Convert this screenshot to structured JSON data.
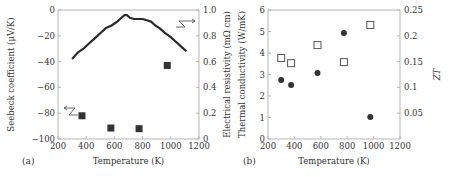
{
  "chart_data": [
    {
      "panel": "a",
      "panel_label": "(a)",
      "type": "line",
      "xlabel": "Temperature (K)",
      "ylabel": "Seebeck coefficient (μV/K)",
      "y2label": "Electrical resistivity (mΩ cm)",
      "xlim": [
        200,
        1200
      ],
      "ylim": [
        -100,
        0
      ],
      "y2lim": [
        0,
        1.0
      ],
      "xticks": [
        200,
        400,
        600,
        800,
        1000,
        1200
      ],
      "yticks": [
        0,
        -20,
        -40,
        -60,
        -80,
        -100
      ],
      "y2ticks": [
        {
          "value": 1.0,
          "label": "1.0"
        },
        {
          "value": 0.8,
          "label": "0.8"
        },
        {
          "value": 0.6,
          "label": "0.6"
        },
        {
          "value": 0.4,
          "label": "0.4"
        },
        {
          "value": 0.2,
          "label": "0.2"
        },
        {
          "value": 0,
          "label": "0"
        }
      ],
      "grid": false,
      "series": [
        {
          "name": "Seebeck coefficient",
          "axis": "left",
          "marker": "line",
          "x": [
            300,
            340,
            380,
            420,
            460,
            500,
            540,
            580,
            620,
            650,
            670,
            690,
            710,
            740,
            770,
            800,
            830,
            860,
            890,
            920,
            960,
            1000,
            1040,
            1080,
            1110
          ],
          "y": [
            -38,
            -33,
            -30,
            -26,
            -22,
            -18,
            -14,
            -12,
            -9,
            -6,
            -4,
            -4,
            -6,
            -7,
            -7,
            -7,
            -8,
            -9,
            -12,
            -14,
            -18,
            -21,
            -25,
            -29,
            -32
          ]
        },
        {
          "name": "Electrical resistivity",
          "axis": "right",
          "marker": "filled-square",
          "x": [
            370,
            575,
            775,
            975
          ],
          "y": [
            0.18,
            0.085,
            0.08,
            0.57
          ]
        }
      ],
      "annotations": [
        {
          "text": "arrow pointing left",
          "target_axis": "left",
          "near_series": "Electrical resistivity squares"
        },
        {
          "text": "arrow pointing right",
          "target_axis": "right",
          "near_series": "Seebeck line"
        }
      ]
    },
    {
      "panel": "b",
      "panel_label": "(b)",
      "type": "scatter",
      "xlabel": "Temperature (K)",
      "ylabel": "Thermal conductivity (W/mK)",
      "y2label": "ZT",
      "xlim": [
        200,
        1200
      ],
      "ylim": [
        0,
        6
      ],
      "y2lim": [
        0,
        0.25
      ],
      "xticks": [
        200,
        400,
        600,
        800,
        1000,
        1200
      ],
      "yticks": [
        0,
        1,
        2,
        3,
        4,
        5,
        6
      ],
      "y2ticks": [
        {
          "value": 0.25,
          "label": "0.25"
        },
        {
          "value": 0.2,
          "label": "0.2"
        },
        {
          "value": 0.15,
          "label": "0.15"
        },
        {
          "value": 0.1,
          "label": "0.1"
        },
        {
          "value": 0.05,
          "label": "0.05"
        }
      ],
      "grid": false,
      "series": [
        {
          "name": "Thermal conductivity",
          "axis": "left",
          "marker": "filled-circle",
          "x": [
            300,
            375,
            575,
            775,
            975
          ],
          "y": [
            2.74,
            2.51,
            3.07,
            4.93,
            1.02
          ]
        },
        {
          "name": "ZT",
          "axis": "right",
          "marker": "open-square",
          "x": [
            300,
            375,
            575,
            775,
            975
          ],
          "y": [
            0.157,
            0.147,
            0.182,
            0.149,
            0.221
          ]
        }
      ]
    }
  ]
}
